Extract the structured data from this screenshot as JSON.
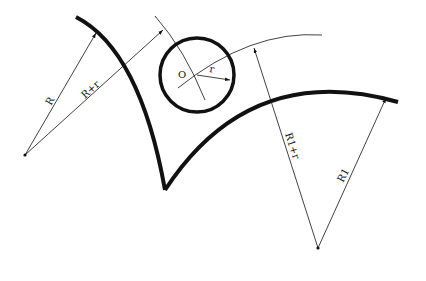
{
  "diagram": {
    "labels": {
      "R": "R",
      "R_plus_r": "R+r",
      "O": "O",
      "r": "r",
      "R1_plus_r": "R1+r",
      "R1": "R1"
    },
    "colors": {
      "stroke": "#111111",
      "background": "#ffffff"
    }
  }
}
